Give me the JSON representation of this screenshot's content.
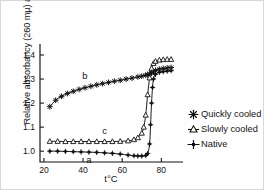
{
  "figure": {
    "background_color": "#ffffff",
    "line_color": "#111111"
  },
  "axes": {
    "ylabel": "Relative absorbancy (260 mµ) at t°C",
    "xlabel": "t°C",
    "yticks": [
      "1.0",
      "1.1",
      "1.2",
      "1.3",
      "1.4"
    ],
    "xticks": [
      "20",
      "40",
      "60",
      "80"
    ],
    "spines": "left-and-bottom"
  },
  "legend": {
    "items": [
      {
        "label": "Quickly cooled",
        "marker": "star-marker",
        "filled": true
      },
      {
        "label": "Slowly cooled",
        "marker": "open-triangle-marker",
        "filled": false
      },
      {
        "label": "Native",
        "marker": "filled-plus-marker",
        "filled": true
      }
    ]
  },
  "curve_labels": [
    {
      "text": "b",
      "series": "quickly-cooled"
    },
    {
      "text": "c",
      "series": "slowly-cooled"
    },
    {
      "text": "a",
      "series": "native"
    }
  ],
  "chart_data": {
    "type": "line",
    "title": "",
    "xlabel": "t°C",
    "ylabel": "Relative absorbancy (260 mµ) at t°C",
    "xlim": [
      18,
      88
    ],
    "ylim": [
      0.955,
      1.425
    ],
    "grid": false,
    "legend_position": "right",
    "series": [
      {
        "name": "Quickly cooled",
        "curve_label": "b",
        "marker": "star",
        "x": [
          23,
          26,
          29,
          32,
          35,
          38,
          41,
          44,
          47,
          50,
          53,
          56,
          59,
          62,
          65,
          68,
          70,
          72,
          73,
          74,
          75,
          76,
          77,
          79,
          81,
          83,
          85
        ],
        "y": [
          1.185,
          1.212,
          1.228,
          1.24,
          1.249,
          1.257,
          1.264,
          1.27,
          1.276,
          1.281,
          1.286,
          1.291,
          1.295,
          1.3,
          1.304,
          1.309,
          1.312,
          1.316,
          1.318,
          1.321,
          1.325,
          1.33,
          1.336,
          1.341,
          1.344,
          1.346,
          1.348
        ]
      },
      {
        "name": "Slowly cooled",
        "curve_label": "c",
        "marker": "open-triangle",
        "x": [
          23,
          27,
          31,
          35,
          39,
          43,
          47,
          51,
          55,
          59,
          63,
          66,
          68,
          70,
          71,
          72,
          73,
          74,
          75,
          76,
          77,
          79,
          81,
          83,
          85
        ],
        "y": [
          1.041,
          1.041,
          1.04,
          1.04,
          1.04,
          1.04,
          1.04,
          1.04,
          1.04,
          1.041,
          1.043,
          1.048,
          1.056,
          1.075,
          1.1,
          1.15,
          1.235,
          1.305,
          1.345,
          1.365,
          1.374,
          1.379,
          1.381,
          1.382,
          1.382
        ]
      },
      {
        "name": "Native",
        "curve_label": "a",
        "marker": "filled-plus",
        "x": [
          23,
          27,
          31,
          35,
          39,
          43,
          47,
          51,
          55,
          59,
          63,
          66,
          68,
          70,
          72,
          73,
          74,
          74.5,
          75,
          75.5,
          76,
          77,
          79,
          81,
          83,
          85
        ],
        "y": [
          1.0,
          1.0,
          0.999,
          0.998,
          0.997,
          0.996,
          0.995,
          0.993,
          0.991,
          0.988,
          0.984,
          0.981,
          0.98,
          0.98,
          0.982,
          0.99,
          1.03,
          1.11,
          1.2,
          1.265,
          1.3,
          1.32,
          1.328,
          1.331,
          1.333,
          1.335
        ]
      }
    ]
  }
}
